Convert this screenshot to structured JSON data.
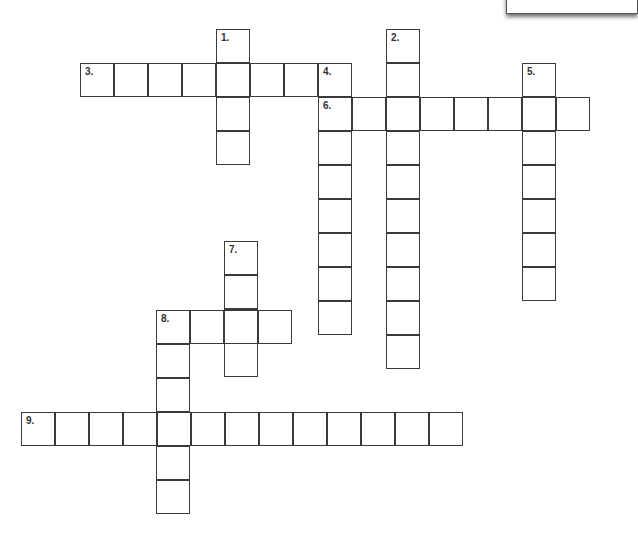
{
  "puzzle": {
    "cell_size": 34,
    "colors": {
      "border": "#3a3a3a",
      "number": "#333333",
      "background": "#ffffff"
    },
    "entries": [
      {
        "number": "1.",
        "direction": "down",
        "x": 216,
        "y": 29,
        "length": 4
      },
      {
        "number": "2.",
        "direction": "down",
        "x": 386,
        "y": 29,
        "length": 10
      },
      {
        "number": "3.",
        "direction": "across",
        "x": 80,
        "y": 63,
        "length": 8
      },
      {
        "number": "4.",
        "direction": "down",
        "x": 318,
        "y": 63,
        "length": 8
      },
      {
        "number": "5.",
        "direction": "down",
        "x": 522,
        "y": 63,
        "length": 7
      },
      {
        "number": "6.",
        "direction": "across",
        "x": 318,
        "y": 97,
        "length": 8
      },
      {
        "number": "7.",
        "direction": "down",
        "x": 224,
        "y": 241,
        "length": 4
      },
      {
        "number": "8.",
        "direction": "across",
        "x": 156,
        "y": 310,
        "length": 4
      },
      {
        "number": "8.",
        "direction": "down",
        "x": 156,
        "y": 310,
        "length": 6
      },
      {
        "number": "9.",
        "direction": "across",
        "x": 21,
        "y": 412,
        "length": 13
      }
    ]
  }
}
